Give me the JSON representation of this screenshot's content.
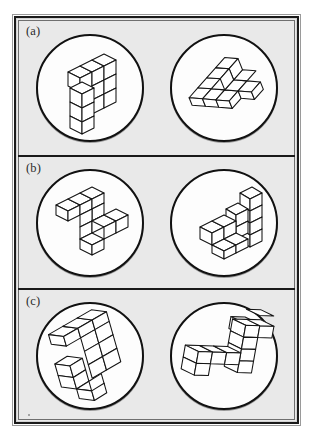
{
  "figure": {
    "background_color": "#e9e9e9",
    "frame_color": "#1a1a1a",
    "disc_fill": "#fdfdfd",
    "cube_stroke": "#141414",
    "panels": [
      {
        "id": "a",
        "label": "(a)",
        "left_item": {
          "name": "mental-rotation-stimulus-a-left",
          "description": "3D block figure of unit cubes, upright orientation",
          "cube_count": 10
        },
        "right_item": {
          "name": "mental-rotation-stimulus-a-right",
          "description": "3D block figure of unit cubes, rotated flat orientation",
          "cube_count": 10
        }
      },
      {
        "id": "b",
        "label": "(b)",
        "left_item": {
          "name": "mental-rotation-stimulus-b-left",
          "description": "3D block figure, zig-zag arm arrangement",
          "cube_count": 10
        },
        "right_item": {
          "name": "mental-rotation-stimulus-b-right",
          "description": "3D block figure, staircase arrangement",
          "cube_count": 10
        }
      },
      {
        "id": "c",
        "label": "(c)",
        "left_item": {
          "name": "mental-rotation-stimulus-c-left",
          "description": "3D block figure, S/Z shaped arrangement",
          "cube_count": 10
        },
        "right_item": {
          "name": "mental-rotation-stimulus-c-right",
          "description": "3D block figure, S/Z shaped arrangement mirrored",
          "cube_count": 10
        }
      }
    ]
  }
}
